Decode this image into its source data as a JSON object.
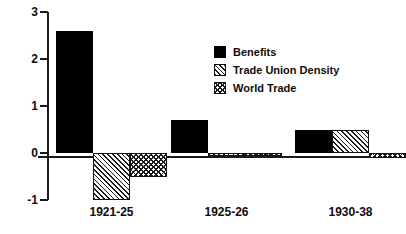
{
  "chart_data": {
    "type": "bar",
    "title": "",
    "subtitle": "",
    "xlabel": "",
    "ylabel": "",
    "categories": [
      "1921-25",
      "1925-26",
      "1930-38"
    ],
    "series": [
      {
        "name": "Benefits",
        "pattern": "solid",
        "values": [
          2.6,
          0.7,
          0.5
        ]
      },
      {
        "name": "Trade Union Density",
        "pattern": "diagonal-hatch",
        "values": [
          -1.0,
          -0.05,
          0.5
        ]
      },
      {
        "name": "World Trade",
        "pattern": "cross-hatch",
        "values": [
          -0.5,
          -0.05,
          -0.1
        ]
      }
    ],
    "ylim": [
      -1,
      3
    ],
    "yticks": [
      3,
      2,
      1,
      0,
      -1
    ],
    "ytick_labels": [
      "3",
      "2",
      "1",
      "0",
      "-1"
    ],
    "grid": false,
    "legend_position": "upper-center-right",
    "zero_line": true,
    "colors": {
      "ink": "#000000",
      "axis": "#1a1a1a",
      "background": "#ffffff"
    }
  },
  "legend": {
    "entries": [
      {
        "label": "Benefits",
        "swatch": "solid-black-swatch"
      },
      {
        "label": "Trade Union Density",
        "swatch": "diagonal-hatch-swatch"
      },
      {
        "label": "World Trade",
        "swatch": "cross-hatch-swatch"
      }
    ]
  },
  "axis": {
    "y_labels": [
      "3",
      "2",
      "1",
      "0",
      "-1"
    ],
    "x_labels": [
      "1921-25",
      "1925-26",
      "1930-38"
    ]
  }
}
